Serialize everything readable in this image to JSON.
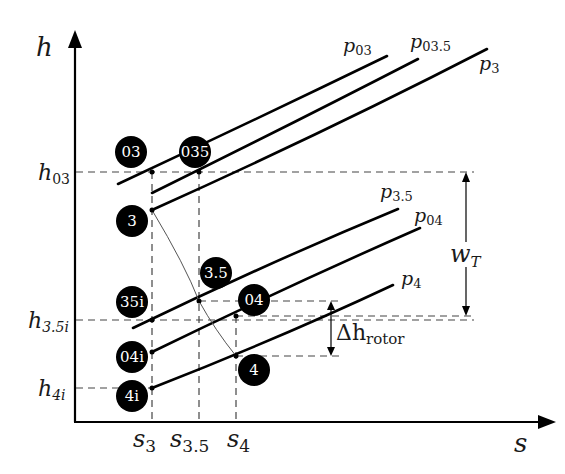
{
  "axes": {
    "y_label": "h",
    "x_label": "s"
  },
  "enthalpy_levels": [
    {
      "id": "h03",
      "main": "h",
      "sub": "03"
    },
    {
      "id": "h35i",
      "main": "h",
      "sub": "3.5i"
    },
    {
      "id": "h4i",
      "main": "h",
      "sub": "4i"
    }
  ],
  "entropy_levels": [
    {
      "id": "s3",
      "main": "s",
      "sub": "3"
    },
    {
      "id": "s35",
      "main": "s",
      "sub": "3.5"
    },
    {
      "id": "s4",
      "main": "s",
      "sub": "4"
    }
  ],
  "isobars": [
    {
      "id": "p03",
      "main": "p",
      "sub": "03"
    },
    {
      "id": "p035",
      "main": "p",
      "sub": "03.5"
    },
    {
      "id": "p3",
      "main": "p",
      "sub": "3"
    },
    {
      "id": "p35",
      "main": "p",
      "sub": "3.5"
    },
    {
      "id": "p04",
      "main": "p",
      "sub": "04"
    },
    {
      "id": "p4",
      "main": "p",
      "sub": "4"
    }
  ],
  "states": [
    {
      "id": "03",
      "label": "03"
    },
    {
      "id": "035",
      "label": "035"
    },
    {
      "id": "3",
      "label": "3"
    },
    {
      "id": "3.5",
      "label": "3.5"
    },
    {
      "id": "35i",
      "label": "35i"
    },
    {
      "id": "04",
      "label": "04"
    },
    {
      "id": "04i",
      "label": "04i"
    },
    {
      "id": "4",
      "label": "4"
    },
    {
      "id": "4i",
      "label": "4i"
    }
  ],
  "dimensions": {
    "turbine_work": {
      "main": "w",
      "sub": "T"
    },
    "rotor_drop": {
      "main": "Δh",
      "sub": "rotor"
    }
  }
}
